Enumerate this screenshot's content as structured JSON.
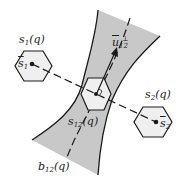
{
  "diagram": {
    "type": "separating band between two hexagonal regions",
    "labels": {
      "s1_q": {
        "base": "s",
        "sub": "1",
        "arg": "(q)"
      },
      "s2_q": {
        "base": "s",
        "sub": "2",
        "arg": "(q)"
      },
      "s1_bar": {
        "base": "s",
        "sub": "1"
      },
      "s2_bar": {
        "base": "s",
        "sub": "2"
      },
      "s12_q": {
        "base": "s",
        "sub": "12",
        "arg": "(q)"
      },
      "b12_q": {
        "base": "b",
        "sub": "12",
        "arg": "(q)"
      },
      "u12_perp": {
        "base": "u",
        "sub": "12",
        "sup": "⊥"
      }
    },
    "colors": {
      "band_fill": "#c8c8c8",
      "hexagon_fill": "#efefef",
      "stroke": "#1a1a1a",
      "background": "#ffffff"
    }
  }
}
